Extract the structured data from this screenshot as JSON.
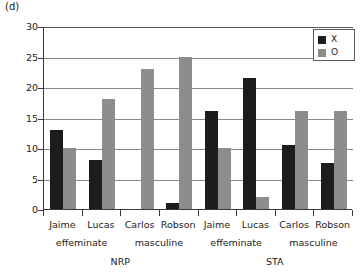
{
  "panel": {
    "label": "(d)"
  },
  "legend": {
    "items": [
      {
        "key": "X",
        "label": "X",
        "color": "#1c1c1c"
      },
      {
        "key": "O",
        "label": "O",
        "color": "#8d8d8d"
      }
    ]
  },
  "axis": {
    "y_ticks": [
      "30",
      "25",
      "20",
      "15",
      "10",
      "5",
      "0"
    ],
    "y_min": 0,
    "y_max": 30
  },
  "groups": [
    {
      "condition": "NRP",
      "style": "effeminate",
      "names": [
        "Jaime",
        "Lucas"
      ]
    },
    {
      "condition": "NRP",
      "style": "masculine",
      "names": [
        "Carlos",
        "Robson"
      ]
    },
    {
      "condition": "STA",
      "style": "effeminate",
      "names": [
        "Jaime",
        "Lucas"
      ]
    },
    {
      "condition": "STA",
      "style": "masculine",
      "names": [
        "Carlos",
        "Robson"
      ]
    }
  ],
  "chart_data": {
    "type": "bar",
    "title": "(d)",
    "xlabel": "",
    "ylabel": "",
    "ylim": [
      0,
      30
    ],
    "yticks": [
      0,
      5,
      10,
      15,
      20,
      25,
      30
    ],
    "grid": true,
    "legend_position": "top-right",
    "categories": [
      "NRP / effeminate / Jaime",
      "NRP / effeminate / Lucas",
      "NRP / masculine / Carlos",
      "NRP / masculine / Robson",
      "STA / effeminate / Jaime",
      "STA / effeminate / Lucas",
      "STA / masculine / Carlos",
      "STA / masculine / Robson"
    ],
    "series": [
      {
        "name": "X",
        "color": "#1c1c1c",
        "values": [
          13,
          8,
          0,
          1,
          16,
          21.5,
          10.5,
          7.5
        ]
      },
      {
        "name": "O",
        "color": "#8d8d8d",
        "values": [
          10,
          18,
          23,
          25,
          10,
          2,
          16,
          16
        ]
      }
    ]
  }
}
